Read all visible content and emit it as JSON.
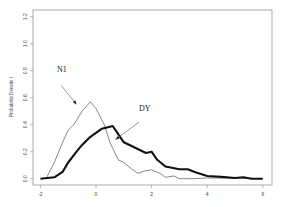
{
  "chart_data": {
    "type": "line",
    "title": "",
    "xlabel": "",
    "ylabel": "Probability Density I",
    "xlim": [
      -2,
      6
    ],
    "ylim": [
      0,
      1.2
    ],
    "xticks": [
      -2,
      0,
      2,
      4,
      6
    ],
    "yticks": [
      0.0,
      0.2,
      0.4,
      0.6,
      0.8,
      1.0,
      1.2
    ],
    "xtick_labels": [
      "-2",
      "0",
      "2",
      "4",
      "6"
    ],
    "ytick_labels": [
      "0.0",
      "0.2",
      "0.4",
      "0.6",
      "0.8",
      "1.0",
      "1.2"
    ],
    "grid": false,
    "legend": "none (inline annotations)",
    "series": [
      {
        "name": "N1",
        "style": "thin",
        "color": "#555555",
        "x": [
          -1.8,
          -1.5,
          -1.2,
          -1.0,
          -0.8,
          -0.5,
          -0.2,
          0.0,
          0.3,
          0.5,
          0.8,
          1.0,
          1.3,
          1.5,
          1.8,
          2.0,
          2.3,
          2.5,
          2.8,
          3.0,
          3.5,
          4.0,
          5.0,
          6.0
        ],
        "values": [
          0.0,
          0.12,
          0.27,
          0.36,
          0.4,
          0.5,
          0.57,
          0.52,
          0.4,
          0.27,
          0.14,
          0.12,
          0.07,
          0.04,
          0.06,
          0.065,
          0.04,
          0.01,
          0.02,
          0.0,
          0.0,
          0.005,
          0.005,
          0.0
        ]
      },
      {
        "name": "DY",
        "style": "thick",
        "color": "#111111",
        "x": [
          -2.0,
          -1.5,
          -1.2,
          -1.0,
          -0.7,
          -0.5,
          -0.2,
          0.0,
          0.2,
          0.4,
          0.6,
          0.8,
          1.0,
          1.3,
          1.5,
          1.8,
          2.0,
          2.2,
          2.5,
          3.0,
          3.3,
          3.6,
          4.0,
          4.5,
          5.0,
          5.3,
          5.6,
          6.0
        ],
        "values": [
          0.0,
          0.01,
          0.05,
          0.12,
          0.2,
          0.25,
          0.31,
          0.34,
          0.37,
          0.38,
          0.39,
          0.33,
          0.27,
          0.24,
          0.22,
          0.19,
          0.2,
          0.14,
          0.09,
          0.07,
          0.07,
          0.045,
          0.02,
          0.013,
          0.005,
          0.01,
          0.0,
          0.0
        ]
      }
    ],
    "annotations": [
      {
        "text": "N1",
        "x": -1.4,
        "y": 0.79,
        "arrow_from": [
          -1.25,
          0.69
        ],
        "arrow_to": [
          -0.7,
          0.55
        ]
      },
      {
        "text": "DY",
        "x": 1.55,
        "y": 0.5,
        "arrow_from": [
          1.55,
          0.42
        ],
        "arrow_to": [
          0.7,
          0.29
        ]
      }
    ]
  }
}
